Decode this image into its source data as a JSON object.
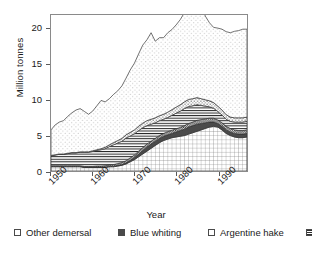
{
  "chart_data": {
    "type": "area",
    "stacked": true,
    "title": "",
    "xlabel": "Year",
    "ylabel": "Million tonnes",
    "xlim": [
      1950,
      1997
    ],
    "ylim": [
      0,
      22
    ],
    "xticks": [
      1950,
      1960,
      1970,
      1980,
      1990
    ],
    "xtick_labels": [
      "1950",
      "1960",
      "1970",
      "1980",
      "1990"
    ],
    "yticks": [
      0,
      5,
      10,
      15,
      20
    ],
    "ytick_labels": [
      "0",
      "5",
      "10",
      "15",
      "20"
    ],
    "grid": false,
    "legend_position": "below",
    "x": [
      1950,
      1951,
      1952,
      1953,
      1954,
      1955,
      1956,
      1957,
      1958,
      1959,
      1960,
      1961,
      1962,
      1963,
      1964,
      1965,
      1966,
      1967,
      1968,
      1969,
      1970,
      1971,
      1972,
      1973,
      1974,
      1975,
      1976,
      1977,
      1978,
      1979,
      1980,
      1981,
      1982,
      1983,
      1984,
      1985,
      1986,
      1987,
      1988,
      1989,
      1990,
      1991,
      1992,
      1993,
      1994,
      1995,
      1996,
      1997
    ],
    "series": [
      {
        "name": "Other demersal",
        "pattern": "crosshatch-grid",
        "color": "#ffffff",
        "values": [
          0.6,
          0.6,
          0.6,
          0.6,
          0.6,
          0.6,
          0.6,
          0.6,
          0.5,
          0.5,
          0.5,
          0.5,
          0.5,
          0.5,
          0.6,
          0.6,
          0.7,
          0.8,
          1.0,
          1.3,
          1.6,
          2.0,
          2.4,
          2.8,
          3.2,
          3.6,
          4.0,
          4.3,
          4.5,
          4.7,
          4.8,
          4.9,
          5.0,
          5.2,
          5.4,
          5.6,
          5.8,
          6.0,
          6.2,
          6.3,
          6.2,
          5.8,
          5.3,
          5.0,
          4.8,
          4.7,
          4.7,
          4.8
        ]
      },
      {
        "name": "Blue whiting",
        "pattern": "solid-dark",
        "color": "#4a4a4a",
        "values": [
          0.05,
          0.05,
          0.05,
          0.05,
          0.05,
          0.05,
          0.05,
          0.05,
          0.05,
          0.05,
          0.05,
          0.05,
          0.05,
          0.05,
          0.05,
          0.05,
          0.1,
          0.1,
          0.15,
          0.2,
          0.3,
          0.4,
          0.5,
          0.6,
          0.6,
          0.6,
          0.6,
          0.6,
          0.6,
          0.6,
          0.7,
          0.8,
          0.9,
          1.0,
          1.0,
          1.0,
          0.9,
          0.8,
          0.7,
          0.6,
          0.5,
          0.5,
          0.5,
          0.5,
          0.5,
          0.5,
          0.5,
          0.5
        ]
      },
      {
        "name": "Argentine hake",
        "pattern": "dense-dots",
        "color": "#3a3a3a",
        "values": [
          0.1,
          0.1,
          0.1,
          0.1,
          0.1,
          0.1,
          0.1,
          0.1,
          0.1,
          0.1,
          0.1,
          0.15,
          0.15,
          0.2,
          0.2,
          0.25,
          0.25,
          0.3,
          0.3,
          0.35,
          0.35,
          0.4,
          0.4,
          0.4,
          0.4,
          0.4,
          0.4,
          0.4,
          0.45,
          0.45,
          0.45,
          0.45,
          0.5,
          0.5,
          0.5,
          0.55,
          0.55,
          0.55,
          0.55,
          0.55,
          0.5,
          0.5,
          0.5,
          0.5,
          0.5,
          0.5,
          0.5,
          0.5
        ]
      },
      {
        "name": "Atlantic cod",
        "pattern": "horizontal-lines",
        "color": "#2f2f2f",
        "values": [
          1.4,
          1.5,
          1.6,
          1.6,
          1.7,
          1.8,
          1.8,
          1.9,
          2.0,
          2.0,
          2.1,
          2.2,
          2.3,
          2.4,
          2.6,
          2.8,
          2.9,
          3.0,
          3.2,
          3.1,
          3.0,
          2.9,
          2.8,
          2.6,
          2.4,
          2.2,
          2.1,
          2.0,
          2.0,
          2.1,
          2.2,
          2.3,
          2.4,
          2.4,
          2.3,
          2.2,
          2.0,
          1.8,
          1.6,
          1.4,
          1.2,
          1.1,
          1.0,
          1.0,
          1.1,
          1.2,
          1.2,
          1.2
        ]
      },
      {
        "name": "Sand eels",
        "pattern": "medium-dots",
        "color": "#6f6f6f",
        "values": [
          0.05,
          0.05,
          0.05,
          0.05,
          0.05,
          0.05,
          0.05,
          0.05,
          0.05,
          0.05,
          0.1,
          0.1,
          0.15,
          0.2,
          0.25,
          0.3,
          0.35,
          0.4,
          0.45,
          0.5,
          0.55,
          0.6,
          0.65,
          0.7,
          0.7,
          0.7,
          0.7,
          0.7,
          0.75,
          0.8,
          0.85,
          0.9,
          0.95,
          1.0,
          1.0,
          1.0,
          0.95,
          0.9,
          0.85,
          0.8,
          0.75,
          0.7,
          0.65,
          0.6,
          0.6,
          0.6,
          0.6,
          0.6
        ]
      },
      {
        "name": "Alaska pollock",
        "pattern": "sparse-dots",
        "color": "#9a9a9a",
        "values": [
          3.6,
          4.2,
          4.5,
          4.7,
          5.2,
          5.6,
          6.0,
          6.1,
          5.7,
          5.3,
          5.6,
          6.2,
          6.8,
          6.4,
          6.5,
          6.8,
          7.0,
          7.4,
          8.0,
          8.8,
          9.4,
          10.2,
          11.0,
          11.4,
          12.2,
          10.8,
          11.0,
          10.8,
          11.2,
          11.3,
          11.6,
          12.0,
          12.6,
          13.2,
          13.8,
          14.2,
          13.4,
          11.8,
          11.0,
          10.6,
          11.0,
          11.4,
          11.7,
          11.9,
          12.2,
          12.3,
          12.5,
          12.4
        ]
      }
    ]
  },
  "axes": {
    "ylabel": "Million tonnes",
    "xlabel": "Year",
    "ytick_labels": [
      "20",
      "15",
      "10",
      "5",
      "0"
    ],
    "xtick_labels": [
      "1950",
      "1960",
      "1970",
      "1980",
      "1990"
    ]
  },
  "legend": {
    "items": [
      {
        "label": "Other demersal",
        "swatch": "sw-otherdemersal",
        "icon": "legend-swatch-other-demersal"
      },
      {
        "label": "Blue whiting",
        "swatch": "sw-bluewhiting",
        "icon": "legend-swatch-blue-whiting"
      },
      {
        "label": "Argentine hake",
        "swatch": "sw-argentinehake",
        "icon": "legend-swatch-argentine-hake"
      },
      {
        "label": "Atlantic cod",
        "swatch": "sw-atlanticcod",
        "icon": "legend-swatch-atlantic-cod"
      },
      {
        "label": "Sand eels",
        "swatch": "sw-sandeels",
        "icon": "legend-swatch-sand-eels"
      },
      {
        "label": "Alaska pollock",
        "swatch": "sw-alaskapollock",
        "icon": "legend-swatch-alaska-pollock"
      }
    ]
  }
}
